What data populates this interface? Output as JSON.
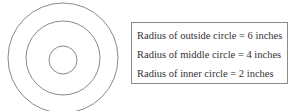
{
  "diagram": {
    "type": "concentric-circles",
    "circles": [
      {
        "name": "outside",
        "radius_inches": 6
      },
      {
        "name": "middle",
        "radius_inches": 4
      },
      {
        "name": "inner",
        "radius_inches": 2
      }
    ],
    "stroke_color": "#8a8a8a"
  },
  "legend": {
    "lines": [
      "Radius of outside circle = 6 inches",
      "Radius of middle circle = 4 inches",
      "Radius of inner circle = 2 inches"
    ]
  }
}
